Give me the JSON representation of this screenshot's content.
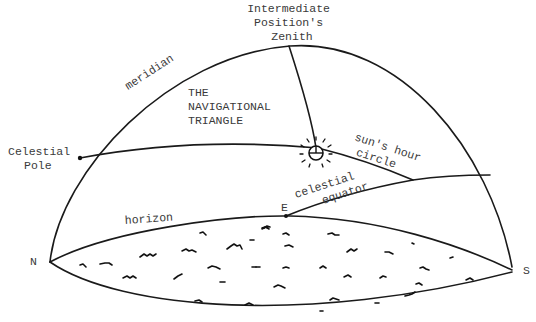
{
  "diagram": {
    "title": "THE NAVIGATIONAL TRIANGLE",
    "labels": {
      "zenith": [
        "Intermediate",
        "Position's",
        "Zenith"
      ],
      "meridian": "meridian",
      "triangle": [
        "THE",
        "NAVIGATIONAL",
        "TRIANGLE"
      ],
      "celestial_pole": [
        "Celestial",
        "Pole"
      ],
      "suns_hour_circle": [
        "sun's hour",
        "circle"
      ],
      "celestial_equator": [
        "celestial",
        "equator"
      ],
      "horizon": "horizon",
      "north": "N",
      "south": "S",
      "east": "E"
    },
    "icons": {
      "sun": "sun-icon"
    },
    "colors": {
      "line": "#1a1a1a",
      "text": "#3a3a3a",
      "background": "#ffffff"
    }
  }
}
